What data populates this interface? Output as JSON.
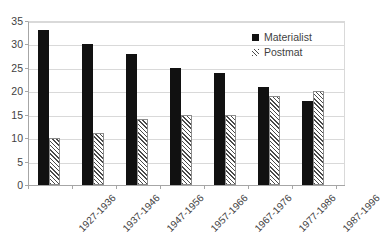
{
  "chart_data": {
    "type": "bar",
    "title": "",
    "subtitle": "",
    "xlabel": "",
    "ylabel": "",
    "ylim": [
      0,
      35
    ],
    "ytick_step": 5,
    "yticks": [
      0,
      5,
      10,
      15,
      20,
      25,
      30,
      35
    ],
    "ytick_labels": [
      "0",
      "5",
      "10",
      "15",
      "20",
      "25",
      "30",
      "35"
    ],
    "grid": true,
    "grid_axis": "y",
    "legend_position": "top-right",
    "categories": [
      "1927-1936",
      "1937-1946",
      "1947-1956",
      "1957-1966",
      "1967-1976",
      "1977-1986",
      "1987-1996"
    ],
    "series": [
      {
        "name": "Materialist",
        "fill": "solid",
        "color": "#111111",
        "values": [
          33,
          30,
          28,
          25,
          24,
          21,
          18
        ]
      },
      {
        "name": "Postmat",
        "fill": "diagonal-hatch",
        "color": "#4a4a4a",
        "values": [
          10,
          11,
          14,
          15,
          15,
          19,
          20
        ]
      }
    ],
    "annotations": []
  },
  "legend": {
    "items": [
      {
        "label": "Materialist",
        "swatch": "solid-square-icon"
      },
      {
        "label": "Postmat",
        "swatch": "hatched-square-icon"
      }
    ]
  },
  "colors": {
    "materialist": "#111111",
    "postmat_hatch": "#4a4a4a",
    "gridline": "#d9d9d9",
    "axis": "#a6a6a6",
    "text": "#3f3f3f",
    "background": "#ffffff"
  }
}
